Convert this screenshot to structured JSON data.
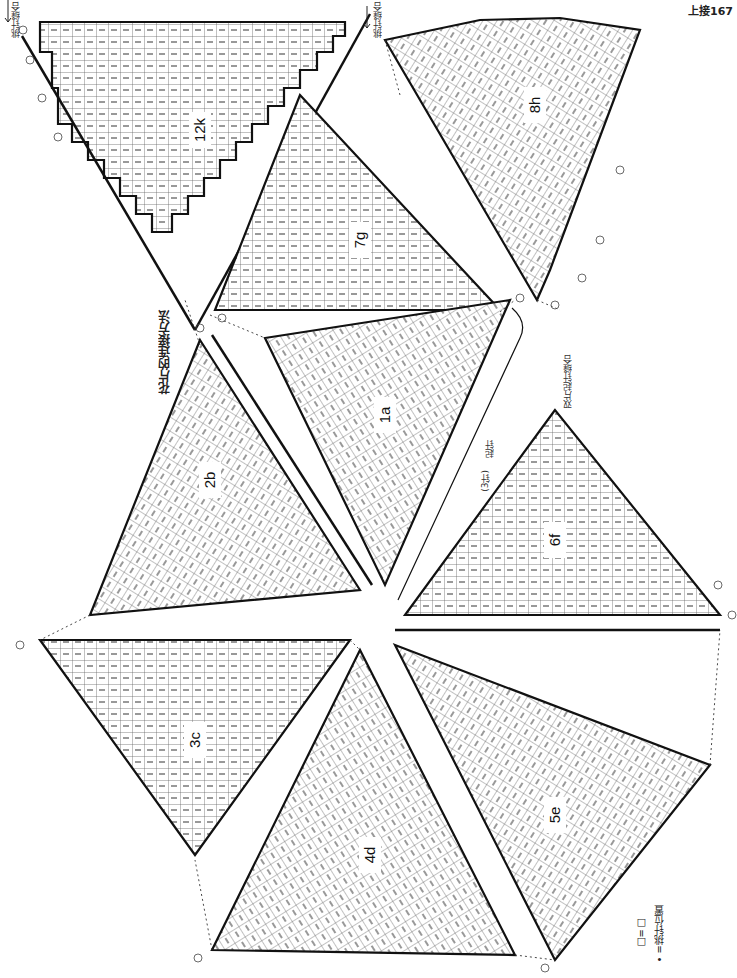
{
  "page": {
    "page_ref": "上接167",
    "title": "花片的连接方法"
  },
  "annotations": {
    "start_top_left": "挑针缝合",
    "start_top_mid": "挑针缝合",
    "join_right": "双片起针缝合",
    "edge_stitch": "起针",
    "edge_count": "(3针)"
  },
  "legend": {
    "box_symbol": "□=□",
    "dot_symbol": "• =挑针位置"
  },
  "pieces": [
    {
      "id": "12k",
      "label": "12k",
      "rows": [
        1,
        5,
        10,
        15,
        20,
        21,
        22
      ]
    },
    {
      "id": "7g",
      "label": "7g",
      "rows": [
        1,
        5,
        10,
        15,
        20,
        21
      ]
    },
    {
      "id": "8h",
      "label": "8h",
      "rows": [
        1,
        5,
        10,
        15,
        20,
        25,
        30,
        31
      ]
    },
    {
      "id": "1a",
      "label": "1a",
      "rows": [
        1,
        5,
        10,
        15,
        20,
        21,
        22
      ]
    },
    {
      "id": "2b",
      "label": "2b",
      "rows": [
        1,
        5,
        10,
        15,
        20,
        25,
        30,
        31
      ]
    },
    {
      "id": "6f",
      "label": "6f",
      "rows": [
        1,
        5,
        10,
        15,
        20,
        21
      ]
    },
    {
      "id": "3c",
      "label": "3c",
      "rows": [
        1,
        5,
        10,
        15,
        20,
        21,
        22
      ]
    },
    {
      "id": "4d",
      "label": "4d",
      "rows": [
        1,
        5,
        10,
        15,
        20,
        25,
        30,
        31
      ]
    },
    {
      "id": "5e",
      "label": "5e",
      "rows": [
        1,
        5,
        10,
        15,
        20,
        25,
        30,
        31
      ]
    }
  ],
  "colors": {
    "line": "#111111",
    "grid": "#555555",
    "paper": "#ffffff"
  }
}
